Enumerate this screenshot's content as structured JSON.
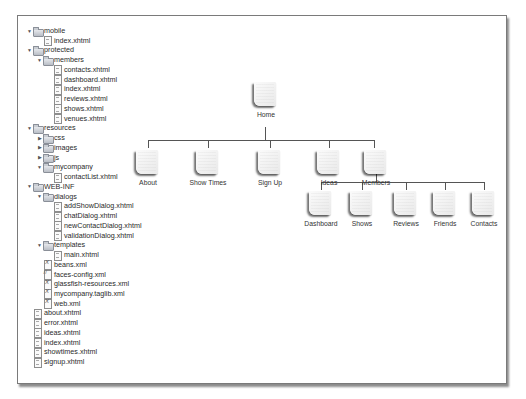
{
  "file_tree": {
    "rows": [
      {
        "label": "mobile",
        "type": "folder",
        "depth": 0,
        "expanded": true
      },
      {
        "label": "index.xhtml",
        "type": "file",
        "depth": 1
      },
      {
        "label": "protected",
        "type": "folder",
        "depth": 0,
        "expanded": true
      },
      {
        "label": "members",
        "type": "folder",
        "depth": 1,
        "expanded": true
      },
      {
        "label": "contacts.xhtml",
        "type": "file",
        "depth": 2
      },
      {
        "label": "dashboard.xhtml",
        "type": "file",
        "depth": 2
      },
      {
        "label": "index.xhtml",
        "type": "file",
        "depth": 2
      },
      {
        "label": "reviews.xhtml",
        "type": "file",
        "depth": 2
      },
      {
        "label": "shows.xhtml",
        "type": "file",
        "depth": 2
      },
      {
        "label": "venues.xhtml",
        "type": "file",
        "depth": 2
      },
      {
        "label": "resources",
        "type": "folder",
        "depth": 0,
        "expanded": true
      },
      {
        "label": "css",
        "type": "folder",
        "depth": 1,
        "expanded": false
      },
      {
        "label": "images",
        "type": "folder",
        "depth": 1,
        "expanded": false
      },
      {
        "label": "js",
        "type": "folder",
        "depth": 1,
        "expanded": false
      },
      {
        "label": "mycompany",
        "type": "folder",
        "depth": 1,
        "expanded": true
      },
      {
        "label": "contactList.xhtml",
        "type": "file",
        "depth": 2
      },
      {
        "label": "WEB-INF",
        "type": "folder",
        "depth": 0,
        "expanded": true
      },
      {
        "label": "dialogs",
        "type": "folder",
        "depth": 1,
        "expanded": true
      },
      {
        "label": "addShowDialog.xhtml",
        "type": "file",
        "depth": 2
      },
      {
        "label": "chatDialog.xhtml",
        "type": "file",
        "depth": 2
      },
      {
        "label": "newContactDialog.xhtml",
        "type": "file",
        "depth": 2
      },
      {
        "label": "validationDialog.xhtml",
        "type": "file",
        "depth": 2
      },
      {
        "label": "templates",
        "type": "folder",
        "depth": 1,
        "expanded": true
      },
      {
        "label": "main.xhtml",
        "type": "file",
        "depth": 2
      },
      {
        "label": "beans.xml",
        "type": "xml",
        "depth": 1
      },
      {
        "label": "faces-config.xml",
        "type": "faces",
        "depth": 1
      },
      {
        "label": "glassfish-resources.xml",
        "type": "xml",
        "depth": 1
      },
      {
        "label": "mycompany.taglib.xml",
        "type": "xml",
        "depth": 1
      },
      {
        "label": "web.xml",
        "type": "xml",
        "depth": 1
      },
      {
        "label": "about.xhtml",
        "type": "file",
        "depth": 0
      },
      {
        "label": "error.xhtml",
        "type": "file",
        "depth": 0
      },
      {
        "label": "ideas.xhtml",
        "type": "file",
        "depth": 0
      },
      {
        "label": "index.xhtml",
        "type": "file",
        "depth": 0
      },
      {
        "label": "showtimes.xhtml",
        "type": "file",
        "depth": 0
      },
      {
        "label": "signup.xhtml",
        "type": "file",
        "depth": 0
      }
    ]
  },
  "site_map": {
    "root": {
      "label": "Home"
    },
    "level1": [
      {
        "label": "About"
      },
      {
        "label": "Show Times"
      },
      {
        "label": "Sign Up"
      },
      {
        "label": "Ideas"
      },
      {
        "label": "Members"
      }
    ],
    "level2_parent": "Members",
    "level2": [
      {
        "label": "Dashboard"
      },
      {
        "label": "Shows"
      },
      {
        "label": "Reviews"
      },
      {
        "label": "Friends"
      },
      {
        "label": "Contacts"
      }
    ]
  }
}
